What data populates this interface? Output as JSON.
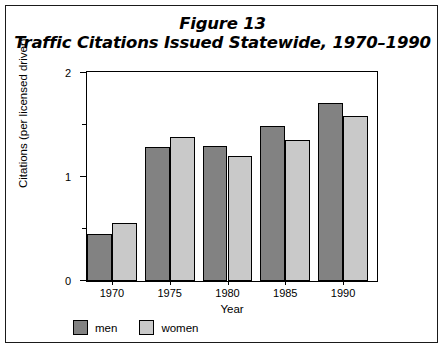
{
  "chart_data": {
    "type": "bar",
    "title": "Figure 13",
    "subtitle": "Traffic Citations Issued Statewide, 1970–1990",
    "xlabel": "Year",
    "ylabel": "Citations (per licensed driver)",
    "categories": [
      "1970",
      "1975",
      "1980",
      "1985",
      "1990"
    ],
    "series": [
      {
        "name": "men",
        "color": "#828282",
        "values": [
          0.45,
          1.29,
          1.3,
          1.49,
          1.71
        ]
      },
      {
        "name": "women",
        "color": "#c9c9c9",
        "values": [
          0.56,
          1.39,
          1.2,
          1.36,
          1.59
        ]
      }
    ],
    "ylim": [
      0,
      2
    ],
    "yticks": [
      0,
      1,
      2
    ],
    "ytick_labels": [
      "0",
      "1",
      "2"
    ],
    "yticks_minor": [
      0.5,
      1.5
    ],
    "grid": false,
    "legend_position": "below-plot-left",
    "frame": true
  },
  "legend": {
    "items": [
      {
        "label": "men"
      },
      {
        "label": "women"
      }
    ]
  },
  "axes": {
    "y_title": "Citations (per licensed driver)",
    "x_title": "Year"
  }
}
